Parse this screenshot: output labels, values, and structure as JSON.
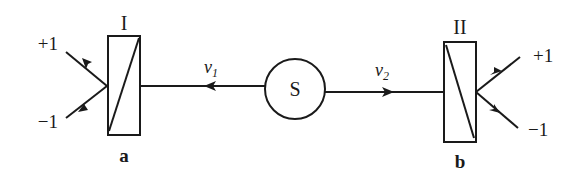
{
  "diagram": {
    "source": {
      "label": "S"
    },
    "beam_left": {
      "symbol": "v",
      "subscript": "1"
    },
    "beam_right": {
      "symbol": "v",
      "subscript": "2"
    },
    "analyzer_left": {
      "roman_label": "I",
      "letter_label": "a",
      "outputs": [
        {
          "label": "+1"
        },
        {
          "label": "−1"
        }
      ]
    },
    "analyzer_right": {
      "roman_label": "II",
      "letter_label": "b",
      "outputs": [
        {
          "label": "+1"
        },
        {
          "label": "−1"
        }
      ]
    },
    "colors": {
      "ink": "#1a1a1a",
      "background": "#ffffff"
    }
  }
}
